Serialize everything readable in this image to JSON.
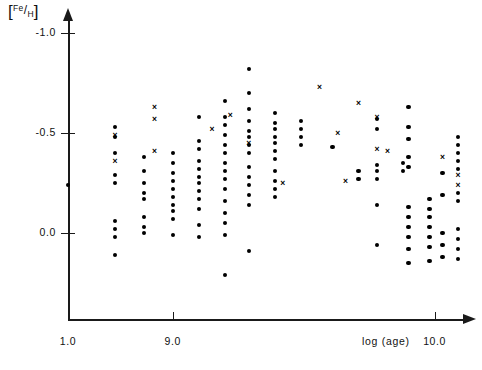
{
  "chart_data": {
    "type": "scatter",
    "title": "",
    "xlabel": "log (age)",
    "ylabel": "[Fe/H]",
    "xlim": [
      8.6,
      10.12
    ],
    "ylim": [
      0.35,
      -1.12
    ],
    "grid": false,
    "legend": "none",
    "xticks": [
      {
        "value": 8.6,
        "label": "1.0"
      },
      {
        "value": 9.0,
        "label": "9.0"
      },
      {
        "value": 10.0,
        "label": "10.0"
      }
    ],
    "yticks": [
      {
        "value": -1.0,
        "label": "-1.0"
      },
      {
        "value": -0.5,
        "label": "-0.5"
      },
      {
        "value": 0.0,
        "label": "0.0"
      }
    ],
    "series": [
      {
        "name": "dots",
        "marker": "filled-circle",
        "color": "#000000",
        "points": [
          [
            8.6,
            -0.24
          ],
          [
            8.78,
            -0.53
          ],
          [
            8.78,
            -0.48
          ],
          [
            8.78,
            -0.4
          ],
          [
            8.78,
            -0.29
          ],
          [
            8.78,
            -0.25
          ],
          [
            8.78,
            -0.06
          ],
          [
            8.78,
            -0.02
          ],
          [
            8.78,
            0.02
          ],
          [
            8.78,
            0.11
          ],
          [
            8.89,
            -0.38
          ],
          [
            8.89,
            -0.31
          ],
          [
            8.89,
            -0.25
          ],
          [
            8.89,
            -0.2
          ],
          [
            8.89,
            -0.17
          ],
          [
            8.89,
            -0.08
          ],
          [
            8.89,
            -0.03
          ],
          [
            8.89,
            0.0
          ],
          [
            9.0,
            -0.4
          ],
          [
            9.0,
            -0.35
          ],
          [
            9.0,
            -0.3
          ],
          [
            9.0,
            -0.26
          ],
          [
            9.0,
            -0.22
          ],
          [
            9.0,
            -0.18
          ],
          [
            9.0,
            -0.14
          ],
          [
            9.0,
            -0.11
          ],
          [
            9.0,
            -0.07
          ],
          [
            9.0,
            0.01
          ],
          [
            9.1,
            -0.58
          ],
          [
            9.1,
            -0.46
          ],
          [
            9.1,
            -0.42
          ],
          [
            9.1,
            -0.36
          ],
          [
            9.1,
            -0.32
          ],
          [
            9.1,
            -0.28
          ],
          [
            9.1,
            -0.25
          ],
          [
            9.1,
            -0.21
          ],
          [
            9.1,
            -0.17
          ],
          [
            9.1,
            -0.12
          ],
          [
            9.1,
            -0.04
          ],
          [
            9.1,
            0.02
          ],
          [
            9.2,
            -0.66
          ],
          [
            9.2,
            -0.58
          ],
          [
            9.2,
            -0.54
          ],
          [
            9.2,
            -0.49
          ],
          [
            9.2,
            -0.44
          ],
          [
            9.2,
            -0.4
          ],
          [
            9.2,
            -0.35
          ],
          [
            9.2,
            -0.31
          ],
          [
            9.2,
            -0.27
          ],
          [
            9.2,
            -0.22
          ],
          [
            9.2,
            -0.16
          ],
          [
            9.2,
            -0.1
          ],
          [
            9.2,
            -0.05
          ],
          [
            9.2,
            0.01
          ],
          [
            9.2,
            0.21
          ],
          [
            9.29,
            -0.82
          ],
          [
            9.29,
            -0.7
          ],
          [
            9.29,
            -0.62
          ],
          [
            9.29,
            -0.56
          ],
          [
            9.29,
            -0.51
          ],
          [
            9.29,
            -0.48
          ],
          [
            9.29,
            -0.44
          ],
          [
            9.29,
            -0.4
          ],
          [
            9.29,
            -0.33
          ],
          [
            9.29,
            -0.28
          ],
          [
            9.29,
            -0.24
          ],
          [
            9.29,
            -0.19
          ],
          [
            9.29,
            -0.14
          ],
          [
            9.29,
            0.09
          ],
          [
            9.39,
            -0.6
          ],
          [
            9.39,
            -0.55
          ],
          [
            9.39,
            -0.52
          ],
          [
            9.39,
            -0.48
          ],
          [
            9.39,
            -0.45
          ],
          [
            9.39,
            -0.41
          ],
          [
            9.39,
            -0.37
          ],
          [
            9.39,
            -0.31
          ],
          [
            9.39,
            -0.26
          ],
          [
            9.39,
            -0.22
          ],
          [
            9.39,
            -0.18
          ],
          [
            9.49,
            -0.56
          ],
          [
            9.49,
            -0.52
          ],
          [
            9.49,
            -0.48
          ],
          [
            9.49,
            -0.44
          ],
          [
            9.61,
            -0.43
          ],
          [
            9.71,
            -0.31
          ],
          [
            9.71,
            -0.27
          ],
          [
            9.78,
            -0.57
          ],
          [
            9.78,
            -0.52
          ],
          [
            9.78,
            -0.34
          ],
          [
            9.78,
            -0.31
          ],
          [
            9.78,
            -0.27
          ],
          [
            9.78,
            -0.14
          ],
          [
            9.78,
            0.06
          ],
          [
            9.88,
            -0.35
          ],
          [
            9.88,
            -0.31
          ],
          [
            9.9,
            -0.63
          ],
          [
            9.9,
            -0.53
          ],
          [
            9.9,
            -0.47
          ],
          [
            9.9,
            -0.38
          ],
          [
            9.9,
            -0.33
          ],
          [
            9.9,
            -0.13
          ],
          [
            9.9,
            -0.08
          ],
          [
            9.9,
            -0.03
          ],
          [
            9.9,
            0.02
          ],
          [
            9.9,
            0.08
          ],
          [
            9.9,
            0.15
          ],
          [
            9.98,
            -0.17
          ],
          [
            9.98,
            -0.12
          ],
          [
            9.98,
            -0.08
          ],
          [
            9.98,
            -0.03
          ],
          [
            9.98,
            0.02
          ],
          [
            9.98,
            0.07
          ],
          [
            9.98,
            0.14
          ],
          [
            10.03,
            -0.3
          ],
          [
            10.03,
            -0.19
          ],
          [
            10.03,
            0.0
          ],
          [
            10.03,
            0.06
          ],
          [
            10.03,
            0.12
          ],
          [
            10.09,
            -0.48
          ],
          [
            10.09,
            -0.44
          ],
          [
            10.09,
            -0.4
          ],
          [
            10.09,
            -0.36
          ],
          [
            10.09,
            -0.32
          ],
          [
            10.09,
            -0.2
          ],
          [
            10.09,
            -0.16
          ],
          [
            10.09,
            -0.02
          ],
          [
            10.09,
            0.03
          ],
          [
            10.09,
            0.08
          ],
          [
            10.09,
            0.13
          ]
        ]
      },
      {
        "name": "crosses",
        "marker": "x",
        "color": "#000000",
        "points": [
          [
            8.78,
            -0.49
          ],
          [
            8.78,
            -0.36
          ],
          [
            8.93,
            -0.63
          ],
          [
            8.93,
            -0.57
          ],
          [
            8.93,
            -0.41
          ],
          [
            9.15,
            -0.52
          ],
          [
            9.22,
            -0.59
          ],
          [
            9.29,
            -0.45
          ],
          [
            9.42,
            -0.25
          ],
          [
            9.56,
            -0.73
          ],
          [
            9.63,
            -0.5
          ],
          [
            9.66,
            -0.26
          ],
          [
            9.71,
            -0.65
          ],
          [
            9.78,
            -0.58
          ],
          [
            9.78,
            -0.42
          ],
          [
            9.82,
            -0.41
          ],
          [
            10.03,
            -0.38
          ],
          [
            10.09,
            -0.29
          ],
          [
            10.09,
            -0.24
          ]
        ]
      }
    ]
  }
}
